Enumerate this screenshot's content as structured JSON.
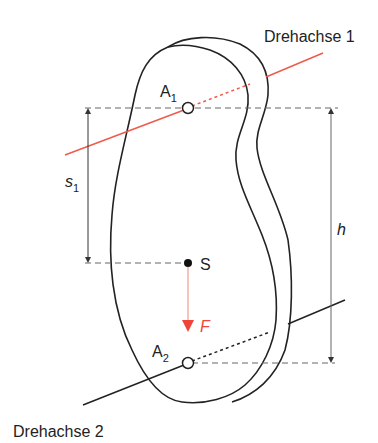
{
  "diagram": {
    "title_axis1": "Drehachse 1",
    "title_axis2": "Drehachse 2",
    "labels": {
      "A1": {
        "main": "A",
        "sub": "1"
      },
      "A2": {
        "main": "A",
        "sub": "2"
      },
      "S": "S",
      "F": "F",
      "s1": {
        "main": "s",
        "sub": "1"
      },
      "h": "h"
    },
    "colors": {
      "outline": "#222222",
      "axis1": "#ef5a4c",
      "force": "#f0443a",
      "dashed": "#666666"
    }
  }
}
